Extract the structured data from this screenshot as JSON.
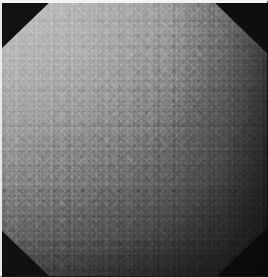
{
  "image": {
    "kind": "dermoscopic-photograph",
    "width": 268,
    "height": 277,
    "color_mode": "grayscale",
    "aperture_shape": "octagonal",
    "subject_description": "Close-up grayscale skin surface with fine mottled granular texture",
    "illumination": "oblique, bright at upper-left falling to dark at lower-right",
    "alt_text": "Grayscale close-up photograph of a textured skin surface seen through an octagonal lens aperture, brightly lit at the upper left and fading to near black at the lower right."
  },
  "palette": {
    "highlight": "#c2c2c2",
    "upper_mid": "#a6a6a6",
    "center": "#8a8a8a",
    "lower_mid": "#5a5a5a",
    "shadow": "#2e2e2e",
    "corner_mask": "#121212",
    "frame_light": "#f2f2f2",
    "frame_dark": "#0d0d0d"
  },
  "regions": [
    {
      "name": "highlight-upper-left",
      "tone": "#b8b8b8",
      "note": "brightest illuminated zone"
    },
    {
      "name": "mottled-mid-band",
      "tone": "#8a8a8a",
      "note": "densest granular texture"
    },
    {
      "name": "shadow-lower-right",
      "tone": "#303030",
      "note": "falloff into shadow"
    },
    {
      "name": "corner-mask-top-left",
      "tone": "#121212",
      "note": "aperture vignette triangle"
    },
    {
      "name": "corner-mask-top-right",
      "tone": "#0e0e0e",
      "note": "aperture vignette triangle"
    },
    {
      "name": "corner-mask-bottom-left",
      "tone": "#111111",
      "note": "aperture vignette triangle"
    },
    {
      "name": "corner-mask-bottom-right",
      "tone": "#0b0b0b",
      "note": "aperture vignette triangle"
    }
  ]
}
